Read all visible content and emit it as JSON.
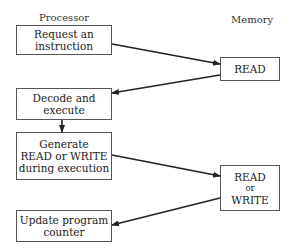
{
  "labels": {
    "processor": "Processor",
    "memory": "Memory"
  },
  "processor_boxes": [
    {
      "lines": [
        "Request an",
        "instruction"
      ]
    },
    {
      "lines": [
        "Decode and",
        "execute"
      ]
    },
    {
      "lines": [
        "Generate",
        "READ or WRITE",
        "during execution"
      ]
    },
    {
      "lines": [
        "Update program",
        "counter"
      ]
    }
  ],
  "memory_boxes": [
    {
      "lines": [
        "READ"
      ]
    },
    {
      "lines": [
        "READ",
        "or",
        "WRITE"
      ]
    }
  ],
  "colors": {
    "line": "#222222",
    "border": "#555555",
    "background": "#ffffff"
  }
}
